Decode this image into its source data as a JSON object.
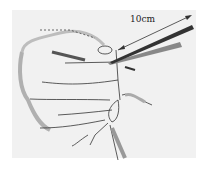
{
  "figure": {
    "measurement_label": "10cm",
    "colors": {
      "background": "#f0f0f0",
      "line": "#333333",
      "shade": "#a8a8a8"
    }
  }
}
